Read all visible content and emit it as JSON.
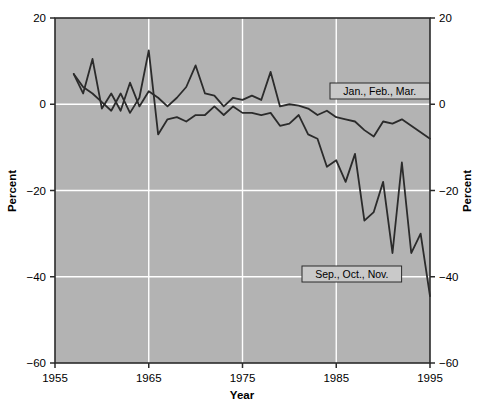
{
  "chart_data": {
    "type": "line",
    "title": "",
    "xlabel": "Year",
    "ylabel": "Percent",
    "xlim": [
      1955,
      1995
    ],
    "ylim": [
      -60,
      20
    ],
    "xticks": [
      1955,
      1965,
      1975,
      1985,
      1995
    ],
    "xtick_labels": [
      "1955",
      "1965",
      "1975",
      "1985",
      "1995"
    ],
    "yticks": [
      20,
      0,
      -20,
      -40,
      -60
    ],
    "ytick_labels": [
      "20",
      "0",
      "−20",
      "−40",
      "−60"
    ],
    "grid": true,
    "grid_color": "#ffffff",
    "plot_background": "#b3b3b3",
    "line_color": "#2b2b2b",
    "right_axis": {
      "ylabel": "Percent",
      "ytick_labels": [
        "20",
        "0",
        "−20",
        "−40",
        "−60"
      ]
    },
    "legend_position": "inline-annotations",
    "series": [
      {
        "name": "Jan., Feb., Mar.",
        "label_text": "Jan., Feb., Mar.",
        "x": [
          1957,
          1958,
          1959,
          1960,
          1961,
          1962,
          1963,
          1964,
          1965,
          1966,
          1967,
          1968,
          1969,
          1970,
          1971,
          1972,
          1973,
          1974,
          1975,
          1976,
          1977,
          1978,
          1979,
          1980,
          1981,
          1982,
          1983,
          1984,
          1985,
          1986,
          1987,
          1988,
          1989,
          1990,
          1991,
          1992,
          1993,
          1994,
          1995
        ],
        "values": [
          7.0,
          2.5,
          10.5,
          -1.0,
          2.5,
          -1.5,
          5.0,
          -0.5,
          3.0,
          1.5,
          -0.5,
          1.5,
          4.0,
          9.0,
          2.5,
          2.0,
          -0.5,
          1.5,
          1.0,
          2.0,
          1.0,
          7.5,
          -0.5,
          0.0,
          -0.3,
          -1.0,
          -2.5,
          -1.5,
          -3.0,
          -3.5,
          -4.0,
          -6.0,
          -7.5,
          -4.0,
          -4.5,
          -3.5,
          -5.0,
          -6.5,
          -8.0
        ]
      },
      {
        "name": "Sep., Oct., Nov.",
        "label_text": "Sep., Oct., Nov.",
        "x": [
          1957,
          1958,
          1959,
          1960,
          1961,
          1962,
          1963,
          1964,
          1965,
          1966,
          1967,
          1968,
          1969,
          1970,
          1971,
          1972,
          1973,
          1974,
          1975,
          1976,
          1977,
          1978,
          1979,
          1980,
          1981,
          1982,
          1983,
          1984,
          1985,
          1986,
          1987,
          1988,
          1989,
          1990,
          1991,
          1992,
          1993,
          1994,
          1995
        ],
        "values": [
          7.0,
          4.0,
          2.5,
          0.5,
          -1.5,
          2.5,
          -2.0,
          1.5,
          12.5,
          -7.0,
          -3.5,
          -3.0,
          -4.0,
          -2.5,
          -2.5,
          -0.5,
          -2.5,
          -0.5,
          -2.0,
          -2.0,
          -2.5,
          -2.0,
          -5.0,
          -4.5,
          -2.5,
          -7.0,
          -8.0,
          -14.5,
          -13.0,
          -18.0,
          -11.5,
          -27.0,
          -25.0,
          -18.0,
          -34.5,
          -13.5,
          -34.5,
          -30.0,
          -44.5
        ]
      }
    ]
  },
  "annotations": [
    {
      "text": "Jan., Feb., Mar.",
      "x_px": 330,
      "y_px": 83
    },
    {
      "text": "Sep., Oct., Nov.",
      "x_px": 302,
      "y_px": 266
    }
  ]
}
